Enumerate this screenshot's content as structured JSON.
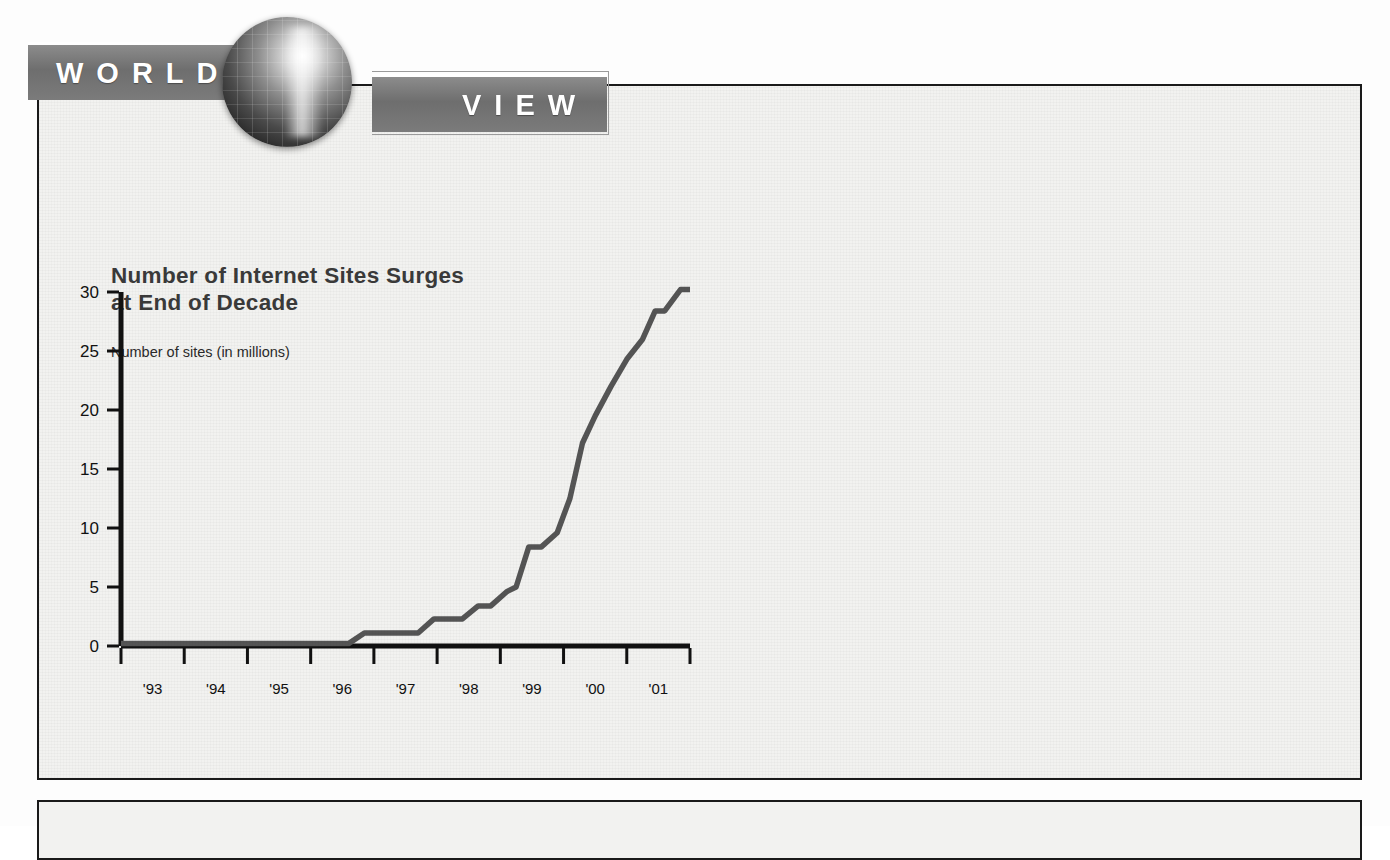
{
  "header": {
    "banner_left": "WORLD",
    "banner_right": "VIEW",
    "globe_icon": "globe-icon"
  },
  "chart_data": {
    "type": "line",
    "title": "Number of Internet Sites Surges at End of Decade",
    "title_line1": "Number of Internet Sites Surges",
    "title_line2": "at End of Decade",
    "ylabel": "Number of sites (in millions)",
    "xlabel": "",
    "grid": false,
    "legend": "none",
    "xlim": [
      1992.5,
      2001.5
    ],
    "ylim": [
      0,
      30
    ],
    "yticks": [
      0,
      5,
      10,
      15,
      20,
      25,
      30
    ],
    "ytick_labels": [
      "0",
      "5",
      "10",
      "15",
      "20",
      "25",
      "30"
    ],
    "xtick_labels": [
      "'93",
      "'94",
      "'95",
      "'96",
      "'97",
      "'98",
      "'99",
      "'00",
      "'01"
    ],
    "line_color": "#555555",
    "axis_color": "#111111",
    "series": [
      {
        "name": "Number of sites (in millions)",
        "x": [
          1992.5,
          1996.1,
          1996.35,
          1996.6,
          1997.2,
          1997.45,
          1997.9,
          1998.15,
          1998.35,
          1998.6,
          1998.75,
          1998.95,
          1999.15,
          1999.4,
          1999.6,
          1999.8,
          2000.0,
          2000.25,
          2000.5,
          2000.75,
          2000.95,
          2001.1,
          2001.35,
          2001.5
        ],
        "values": [
          0.2,
          0.2,
          1.1,
          1.1,
          1.1,
          2.3,
          2.3,
          3.4,
          3.4,
          4.6,
          5.0,
          8.4,
          8.4,
          9.6,
          12.5,
          17.2,
          19.5,
          22.0,
          24.3,
          26.0,
          28.4,
          28.4,
          30.2,
          30.2
        ]
      }
    ],
    "annotations": []
  },
  "source": {
    "prefix": "Source: Federal Reserve Bank of Dallas,",
    "italic": "Southwest Economy,",
    "suffix": "July–August 2001. www.dallasfed.gov",
    "full": "Source: Federal Reserve Bank of Dallas, Southwest Economy, July–August 2001. www.dallasfed.gov"
  }
}
